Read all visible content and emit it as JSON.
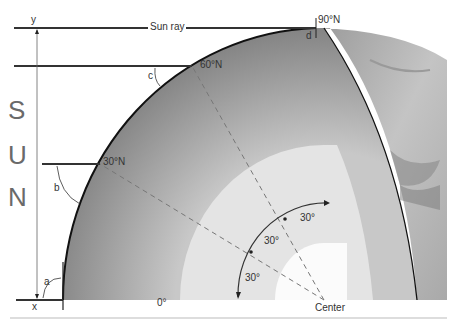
{
  "diagram": {
    "sun_letters": [
      "S",
      "U",
      "N"
    ],
    "sun_ray_label": "Sun ray",
    "axis_labels": {
      "top": "y",
      "bottom": "x"
    },
    "latitudes": [
      {
        "label": "0°"
      },
      {
        "label": "30°N"
      },
      {
        "label": "60°N"
      },
      {
        "label": "90°N"
      }
    ],
    "angle_labels": {
      "a": "a",
      "b": "b",
      "c": "c",
      "d": "d"
    },
    "center_label": "Center",
    "arc_angles": [
      "30°",
      "30°",
      "30°"
    ],
    "colors": {
      "outer_layer": "#8e8e8e",
      "middle_layer": "#e6e6e6",
      "inner_core": "#f7f7f7",
      "surface_texture": "#b5b5b5",
      "lines": "#222222",
      "sun_text": "#6a6a6a"
    }
  }
}
